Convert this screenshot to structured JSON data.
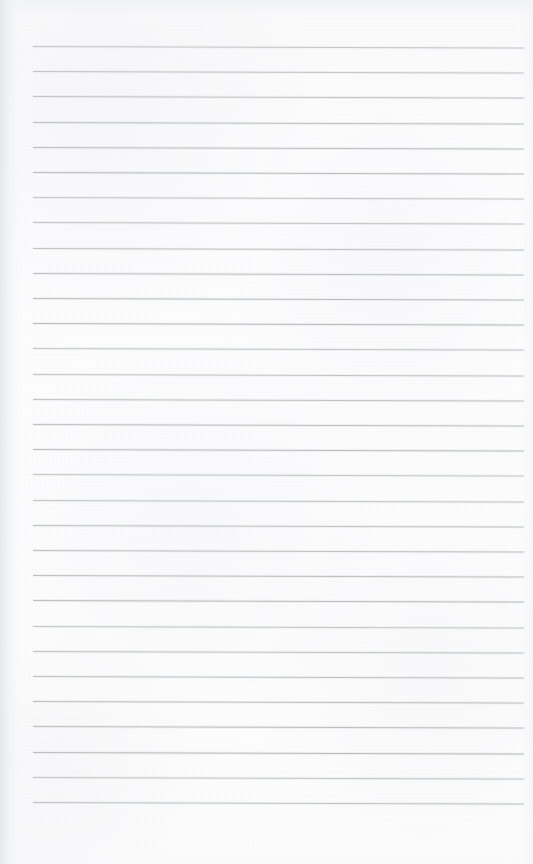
{
  "document": {
    "kind": "scanned-page",
    "title": "Blank ruled notebook page",
    "content_text": "",
    "page_width": 533,
    "page_height": 864,
    "background_color": "#fcfcfd",
    "has_text": false,
    "has_handwriting": false,
    "has_images": false,
    "orientation": "portrait"
  },
  "ruling": {
    "style": "horizontal-ruled",
    "line_color": "#b9bcc1",
    "line_thickness_px": 1,
    "line_count": 31,
    "first_line_y": 46,
    "line_spacing_px": 25.2,
    "line_start_x": 33,
    "line_end_x": 524,
    "skew_degrees": 0.18,
    "margin_left_px": 33,
    "margin_right_px": 9,
    "margin_top_px": 46,
    "margin_bottom_px": 59,
    "has_vertical_margin_rule": false
  },
  "scan_artifacts": {
    "left_edge_shadow_color": "#e4e5e8",
    "top_edge_shadow_color": "#ecedf0",
    "right_edge_shadow_color": "#f2f3f5",
    "paper_tone_light": "#fdfdfe",
    "paper_tone_mid": "#fcfcfd",
    "paper_tone_shaded": "#f6f6f8",
    "grain_visible": true
  }
}
